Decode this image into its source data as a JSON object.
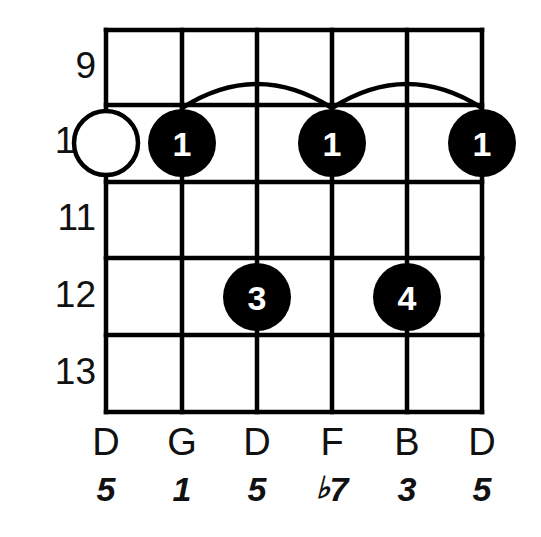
{
  "diagram": {
    "type": "guitar-chord-diagram",
    "title": "",
    "colors": {
      "background": "#ffffff",
      "line": "#000000",
      "filled_dot": "#000000",
      "open_dot_fill": "#ffffff",
      "finger_text": "#ffffff",
      "label_text": "#111111"
    },
    "grid": {
      "string_count": 6,
      "fret_count": 5,
      "left": 106,
      "right": 482,
      "top": 30,
      "bottom": 412,
      "string_x": [
        106,
        182,
        257,
        332,
        407,
        482
      ],
      "fret_y": [
        30,
        105,
        182,
        258,
        335,
        412
      ],
      "line_width": 4.5
    },
    "fret_numbers": [
      {
        "label": "9",
        "y": 68
      },
      {
        "label": "10",
        "y": 143
      },
      {
        "label": "11",
        "y": 220
      },
      {
        "label": "12",
        "y": 297
      },
      {
        "label": "13",
        "y": 374
      }
    ],
    "markers": [
      {
        "name": "open-string-marker-string-1",
        "string": 1,
        "x": 106,
        "y": 143,
        "radius": 32,
        "style": "open",
        "finger": ""
      },
      {
        "name": "finger-dot-string-2",
        "string": 2,
        "x": 182,
        "y": 143,
        "radius": 34,
        "style": "filled",
        "finger": "1"
      },
      {
        "name": "finger-dot-string-4",
        "string": 4,
        "x": 332,
        "y": 143,
        "radius": 34,
        "style": "filled",
        "finger": "1"
      },
      {
        "name": "finger-dot-string-6",
        "string": 6,
        "x": 482,
        "y": 143,
        "radius": 34,
        "style": "filled",
        "finger": "1"
      },
      {
        "name": "finger-dot-string-3-fret-12",
        "string": 3,
        "x": 257,
        "y": 297,
        "radius": 34,
        "style": "filled",
        "finger": "3"
      },
      {
        "name": "finger-dot-string-5-fret-12",
        "string": 5,
        "x": 407,
        "y": 297,
        "radius": 34,
        "style": "filled",
        "finger": "4"
      }
    ],
    "barres": [
      {
        "name": "barre-arc-g-to-f",
        "from_x": 182,
        "to_x": 332,
        "base_y": 108,
        "peak_y": 84
      },
      {
        "name": "barre-arc-f-to-d",
        "from_x": 332,
        "to_x": 482,
        "base_y": 108,
        "peak_y": 84
      }
    ],
    "strings": [
      {
        "index": 1,
        "x": 106,
        "note": "D",
        "interval": "5",
        "flat": false
      },
      {
        "index": 2,
        "x": 182,
        "note": "G",
        "interval": "1",
        "flat": false
      },
      {
        "index": 3,
        "x": 257,
        "note": "D",
        "interval": "5",
        "flat": false
      },
      {
        "index": 4,
        "x": 332,
        "note": "F",
        "interval": "7",
        "flat": true
      },
      {
        "index": 5,
        "x": 407,
        "note": "B",
        "interval": "3",
        "flat": false
      },
      {
        "index": 6,
        "x": 482,
        "note": "D",
        "interval": "5",
        "flat": false
      }
    ],
    "note_name_row_y": 445,
    "interval_row_y": 492,
    "flat_symbol": "♭"
  }
}
